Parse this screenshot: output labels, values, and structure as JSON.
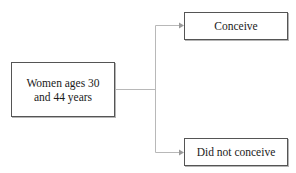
{
  "diagram": {
    "source_node": {
      "label": "Women ages 30 and 44 years"
    },
    "outcomes": [
      {
        "label": "Conceive"
      },
      {
        "label": "Did not conceive"
      }
    ],
    "colors": {
      "box_border": "#555555",
      "connector": "#b0b0b0",
      "text": "#1a1a1a"
    }
  }
}
